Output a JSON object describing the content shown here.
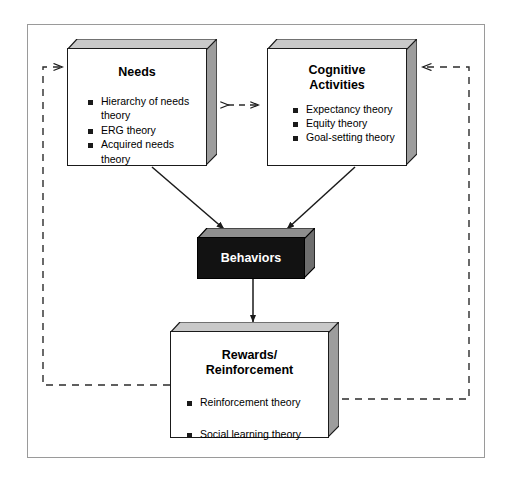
{
  "diagram": {
    "colors": {
      "frame_border": "#9a9a9a",
      "box_border": "#1a1a1a",
      "box_fill": "#ffffff",
      "bevel_light": "#d4d4d4",
      "bevel_dark": "#8a8a8a",
      "dark_box_fill": "#121212",
      "dark_box_text": "#ffffff",
      "connector_solid": "#1a1a1a",
      "connector_dashed": "#3a3a3a",
      "bullet": "#1a1a1a"
    },
    "boxes": [
      {
        "id": "needs",
        "title": "Needs",
        "items": [
          "Hierarchy of needs theory",
          "ERG theory",
          "Acquired needs theory"
        ]
      },
      {
        "id": "cognitive",
        "title": "Cognitive\nActivities",
        "title_line1": "Cognitive",
        "title_line2": "Activities",
        "items": [
          "Expectancy theory",
          "Equity theory",
          "Goal-setting theory"
        ]
      },
      {
        "id": "behaviors",
        "title": "Behaviors",
        "items": []
      },
      {
        "id": "rewards",
        "title": "Rewards/\nReinforcement",
        "title_line1": "Rewards/",
        "title_line2": "Reinforcement",
        "items": [
          "Reinforcement theory",
          "Social learning theory"
        ]
      }
    ],
    "connectors": [
      {
        "name": "needs-to-cognitive-bidirectional",
        "style": "dashed",
        "arrows": "both",
        "from": "needs",
        "to": "cognitive"
      },
      {
        "name": "needs-to-behaviors",
        "style": "solid",
        "arrows": "end",
        "from": "needs",
        "to": "behaviors"
      },
      {
        "name": "cognitive-to-behaviors",
        "style": "solid",
        "arrows": "end",
        "from": "cognitive",
        "to": "behaviors"
      },
      {
        "name": "behaviors-to-rewards",
        "style": "solid",
        "arrows": "end",
        "from": "behaviors",
        "to": "rewards"
      },
      {
        "name": "rewards-feedback-to-needs",
        "style": "dashed",
        "arrows": "end",
        "from": "rewards",
        "to": "needs"
      },
      {
        "name": "rewards-feedback-to-cognitive",
        "style": "dashed",
        "arrows": "end",
        "from": "rewards",
        "to": "cognitive"
      }
    ]
  }
}
